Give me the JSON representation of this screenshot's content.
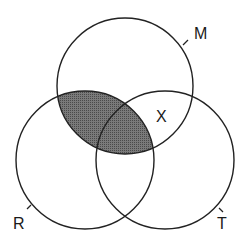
{
  "diagram": {
    "type": "venn",
    "sets": [
      {
        "id": "M",
        "label": "M",
        "cx": 125,
        "cy": 86,
        "r": 68
      },
      {
        "id": "R",
        "label": "R",
        "cx": 85,
        "cy": 160,
        "r": 69
      },
      {
        "id": "T",
        "label": "T",
        "cx": 165,
        "cy": 160,
        "r": 69
      }
    ],
    "shaded_region": "M ∩ R (including M ∩ R ∩ T)",
    "region_label": "X",
    "region_label_location": "M ∩ T only",
    "colors": {
      "stroke": "#222222",
      "shade": "#6e6e6e",
      "background": "#ffffff"
    }
  }
}
